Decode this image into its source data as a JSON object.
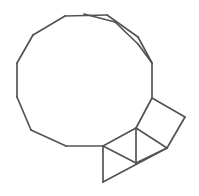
{
  "figure": {
    "background_color": "#ffffff",
    "stroke_color": "#54544f",
    "stroke_width": 1.7,
    "canvas": {
      "width": 199,
      "height": 196
    }
  },
  "chart_data": {
    "type": "diagram",
    "xlabel": "",
    "ylabel": "",
    "xlim": [
      0,
      199
    ],
    "ylim": [
      0,
      196
    ],
    "grid": false,
    "legend": "none",
    "shapes": [
      {
        "name": "decagon",
        "sides": 10,
        "label": "Regular decagon",
        "points": "84,14 115,22 138,44 146,75 138,106 115,128 84,136 53,128 30,106 22,75 30,44 53,22"
      },
      {
        "name": "square",
        "sides": 4,
        "label": "Rotated square",
        "points": "136,128 152,98 185,117 167,148"
      },
      {
        "name": "triangle-upper",
        "sides": 3,
        "label": "Upper triangle",
        "points": "103,146 136,128 136,163"
      },
      {
        "name": "triangle-right",
        "sides": 3,
        "label": "Right triangle",
        "points": "136,128 167,148 136,163"
      },
      {
        "name": "triangle-lower",
        "sides": 3,
        "label": "Lower triangle",
        "points": "103,146 136,163 103,182"
      }
    ],
    "segments": [
      {
        "name": "decagon-edge-top",
        "x1": 84,
        "y1": 14,
        "x2": 115,
        "y2": 22
      },
      {
        "name": "decagon-edge-top-right",
        "x1": 115,
        "y1": 22,
        "x2": 138,
        "y2": 44
      },
      {
        "name": "decagon-edge-right-upper",
        "x1": 138,
        "y1": 44,
        "x2": 152,
        "y2": 63
      },
      {
        "name": "decagon-edge-right",
        "x1": 152,
        "y1": 63,
        "x2": 152,
        "y2": 98
      },
      {
        "name": "decagon-edge-right-lower",
        "x1": 152,
        "y1": 98,
        "x2": 136,
        "y2": 128
      },
      {
        "name": "decagon-edge-bottom-right",
        "x1": 136,
        "y1": 128,
        "x2": 103,
        "y2": 146
      },
      {
        "name": "decagon-edge-bottom",
        "x1": 103,
        "y1": 146,
        "x2": 66,
        "y2": 146
      },
      {
        "name": "decagon-edge-bottom-left",
        "x1": 66,
        "y1": 146,
        "x2": 31,
        "y2": 130
      },
      {
        "name": "decagon-edge-left-lower",
        "x1": 31,
        "y1": 130,
        "x2": 17,
        "y2": 97
      },
      {
        "name": "decagon-edge-left",
        "x1": 17,
        "y1": 97,
        "x2": 17,
        "y2": 63
      },
      {
        "name": "decagon-edge-left-upper",
        "x1": 17,
        "y1": 63,
        "x2": 33,
        "y2": 35
      },
      {
        "name": "decagon-edge-top-left",
        "x1": 33,
        "y1": 35,
        "x2": 65,
        "y2": 16
      },
      {
        "name": "decagon-edge-top-flat",
        "x1": 65,
        "y1": 16,
        "x2": 107,
        "y2": 15
      },
      {
        "name": "decagon-edge-upper-right",
        "x1": 107,
        "y1": 15,
        "x2": 138,
        "y2": 37
      },
      {
        "name": "decagon-edge-right-top",
        "x1": 138,
        "y1": 37,
        "x2": 152,
        "y2": 63
      },
      {
        "name": "square-edge-top",
        "x1": 152,
        "y1": 98,
        "x2": 185,
        "y2": 117
      },
      {
        "name": "square-edge-right",
        "x1": 185,
        "y1": 117,
        "x2": 167,
        "y2": 148
      },
      {
        "name": "square-edge-bottom",
        "x1": 167,
        "y1": 148,
        "x2": 136,
        "y2": 128
      },
      {
        "name": "triangle-vertical-inner",
        "x1": 136,
        "y1": 128,
        "x2": 136,
        "y2": 163
      },
      {
        "name": "triangle-right-lower",
        "x1": 167,
        "y1": 148,
        "x2": 136,
        "y2": 163
      },
      {
        "name": "triangle-diagonal-mid",
        "x1": 103,
        "y1": 146,
        "x2": 136,
        "y2": 163
      },
      {
        "name": "triangle-left-vertical",
        "x1": 103,
        "y1": 146,
        "x2": 103,
        "y2": 182
      },
      {
        "name": "triangle-bottom-diagonal",
        "x1": 103,
        "y1": 182,
        "x2": 167,
        "y2": 148
      }
    ]
  }
}
